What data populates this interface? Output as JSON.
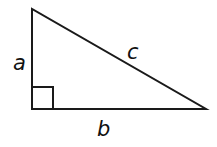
{
  "diagram": {
    "type": "right-triangle",
    "labels": {
      "vertical_leg": "a",
      "horizontal_leg": "b",
      "hypotenuse": "c"
    },
    "right_angle_marker": true,
    "stroke_color": "#1a1a1a",
    "background": "#ffffff"
  }
}
